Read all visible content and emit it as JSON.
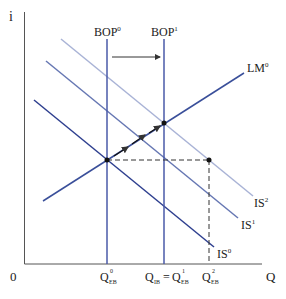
{
  "diagram": {
    "axes": {
      "y_label": "i",
      "x_label": "Q",
      "origin_label": "0"
    },
    "curves": {
      "bop0": {
        "label": "BOP",
        "sup": "0"
      },
      "bop1": {
        "label": "BOP",
        "sup": "1"
      },
      "lm0": {
        "label": "LM",
        "sup": "0"
      },
      "is0": {
        "label": "IS",
        "sup": "0"
      },
      "is1": {
        "label": "IS",
        "sup": "1"
      },
      "is2": {
        "label": "IS",
        "sup": "2"
      }
    },
    "x_ticks": {
      "q0": {
        "main": "Q",
        "sup": "0",
        "sub": "EB"
      },
      "q1_left": {
        "main": "Q",
        "sub": "IB"
      },
      "q1_eq": "=",
      "q1_right": {
        "main": "Q",
        "sup": "1",
        "sub": "EB"
      },
      "q2": {
        "main": "Q",
        "sup": "2",
        "sub": "EB"
      }
    },
    "colors": {
      "axis": "#555555",
      "bop": "#4a5aa8",
      "lm": "#3a4f9a",
      "is0": "#2e3f8f",
      "is1": "#6677b3",
      "is2": "#a9b3d6",
      "dashed": "#333333",
      "point": "#111111"
    }
  }
}
